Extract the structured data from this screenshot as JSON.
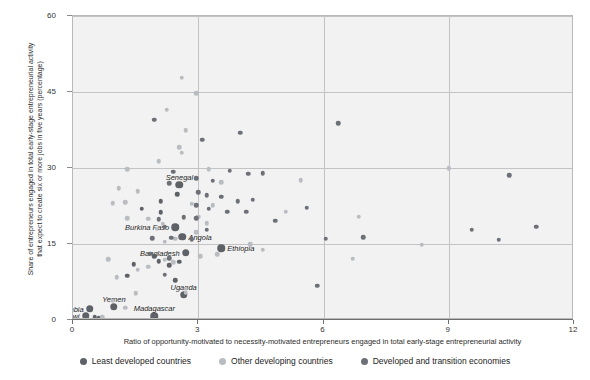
{
  "chart_data": {
    "type": "scatter",
    "title": "",
    "xlabel": "Ratio of opportunity-motivated to necessity-motivated entrepreneurs engaged in total early-stage entrepreneurial activity",
    "ylabel_line1": "Share of entrepreneurs engaged in total early-stage entrepreneurial activity",
    "ylabel_line2": "that expect to create six or more jobs in five years (percentage)",
    "xlim": [
      0,
      12
    ],
    "ylim": [
      0,
      60
    ],
    "xticks": [
      0,
      3,
      6,
      9,
      12
    ],
    "yticks": [
      0,
      15,
      30,
      45,
      60
    ],
    "grid": true,
    "legend_position": "bottom",
    "colors": {
      "least_developed": "#5e6166",
      "other_developing": "#b9bcc0",
      "developed_transition": "#6d7076",
      "plot_background": "#f2f2f2",
      "gridline": "#c3c3c3",
      "axis": "#6f6f6f"
    },
    "series": [
      {
        "name": "Least developed countries",
        "key": "ldc",
        "points": [
          {
            "x": 0.3,
            "y": 0.8,
            "label": "Malawi",
            "label_pos": "left"
          },
          {
            "x": 0.52,
            "y": 0.5
          },
          {
            "x": 0.62,
            "y": 0.3
          },
          {
            "x": 0.4,
            "y": 2.2,
            "label": "Zambia",
            "label_pos": "left"
          },
          {
            "x": 0.98,
            "y": 2.6,
            "label": "Yemen",
            "label_pos": "above"
          },
          {
            "x": 1.95,
            "y": 0.7,
            "label": "Madagascar",
            "label_pos": "above"
          },
          {
            "x": 2.65,
            "y": 5.0,
            "label": "Uganda",
            "label_pos": "above"
          },
          {
            "x": 2.45,
            "y": 7.8
          },
          {
            "x": 2.55,
            "y": 11.5
          },
          {
            "x": 2.3,
            "y": 10.8
          },
          {
            "x": 2.7,
            "y": 13.3,
            "label": "Bangladesh",
            "label_pos": "left"
          },
          {
            "x": 2.62,
            "y": 16.4,
            "label": "Angola",
            "label_pos": "right"
          },
          {
            "x": 2.45,
            "y": 18.3,
            "label": "Burkina Faso",
            "label_pos": "left"
          },
          {
            "x": 3.55,
            "y": 14.2,
            "label": "Ethiopia",
            "label_pos": "right"
          },
          {
            "x": 2.1,
            "y": 23.4
          },
          {
            "x": 2.1,
            "y": 21.3
          },
          {
            "x": 2.5,
            "y": 24.8
          },
          {
            "x": 2.55,
            "y": 26.7,
            "label": "Senegal",
            "label_pos": "above"
          },
          {
            "x": 1.65,
            "y": 22.0
          },
          {
            "x": 1.95,
            "y": 12.6
          },
          {
            "x": 2.05,
            "y": 11.6
          },
          {
            "x": 1.45,
            "y": 11.0
          },
          {
            "x": 1.3,
            "y": 8.7
          }
        ]
      },
      {
        "name": "Other developing countries",
        "key": "odc",
        "points": [
          {
            "x": 2.6,
            "y": 47.8
          },
          {
            "x": 2.25,
            "y": 41.5
          },
          {
            "x": 2.95,
            "y": 44.8
          },
          {
            "x": 2.7,
            "y": 37.5
          },
          {
            "x": 2.55,
            "y": 34.1
          },
          {
            "x": 2.6,
            "y": 33.0
          },
          {
            "x": 2.05,
            "y": 31.3
          },
          {
            "x": 1.3,
            "y": 29.8
          },
          {
            "x": 3.25,
            "y": 29.8
          },
          {
            "x": 3.55,
            "y": 27.2
          },
          {
            "x": 5.45,
            "y": 27.6
          },
          {
            "x": 1.1,
            "y": 26.0
          },
          {
            "x": 1.55,
            "y": 25.4
          },
          {
            "x": 0.95,
            "y": 23.0
          },
          {
            "x": 1.25,
            "y": 23.2
          },
          {
            "x": 1.3,
            "y": 20.1
          },
          {
            "x": 1.8,
            "y": 20.0
          },
          {
            "x": 2.15,
            "y": 19.0
          },
          {
            "x": 2.0,
            "y": 18.0
          },
          {
            "x": 3.0,
            "y": 20.4
          },
          {
            "x": 3.2,
            "y": 19.1
          },
          {
            "x": 2.95,
            "y": 17.3
          },
          {
            "x": 2.45,
            "y": 16.0
          },
          {
            "x": 2.2,
            "y": 15.4
          },
          {
            "x": 3.45,
            "y": 13.0
          },
          {
            "x": 3.05,
            "y": 12.6
          },
          {
            "x": 2.4,
            "y": 11.4
          },
          {
            "x": 2.2,
            "y": 11.9
          },
          {
            "x": 1.8,
            "y": 10.5
          },
          {
            "x": 1.55,
            "y": 9.9
          },
          {
            "x": 1.05,
            "y": 8.4
          },
          {
            "x": 1.5,
            "y": 5.3
          },
          {
            "x": 0.95,
            "y": 3.8
          },
          {
            "x": 1.25,
            "y": 2.4
          },
          {
            "x": 0.7,
            "y": 0.6
          },
          {
            "x": 2.7,
            "y": 5.4
          },
          {
            "x": 2.7,
            "y": 6.2
          },
          {
            "x": 4.55,
            "y": 13.9
          },
          {
            "x": 4.25,
            "y": 15.0
          },
          {
            "x": 6.7,
            "y": 12.1
          },
          {
            "x": 6.85,
            "y": 20.4
          },
          {
            "x": 5.1,
            "y": 21.4
          },
          {
            "x": 8.35,
            "y": 14.9
          },
          {
            "x": 9.0,
            "y": 30.0
          },
          {
            "x": 2.85,
            "y": 22.9
          },
          {
            "x": 3.35,
            "y": 22.6
          },
          {
            "x": 0.85,
            "y": 12.0
          }
        ]
      },
      {
        "name": "Developed and transition economies",
        "key": "dte",
        "points": [
          {
            "x": 1.95,
            "y": 39.5
          },
          {
            "x": 3.1,
            "y": 35.6
          },
          {
            "x": 4.0,
            "y": 37.0
          },
          {
            "x": 6.35,
            "y": 38.8
          },
          {
            "x": 3.75,
            "y": 29.5
          },
          {
            "x": 4.2,
            "y": 28.9
          },
          {
            "x": 4.55,
            "y": 29.0
          },
          {
            "x": 2.4,
            "y": 29.3
          },
          {
            "x": 2.95,
            "y": 28.0
          },
          {
            "x": 3.35,
            "y": 27.5
          },
          {
            "x": 2.3,
            "y": 27.0
          },
          {
            "x": 3.2,
            "y": 24.6
          },
          {
            "x": 3.55,
            "y": 24.3
          },
          {
            "x": 3.95,
            "y": 23.4
          },
          {
            "x": 4.3,
            "y": 23.7
          },
          {
            "x": 2.95,
            "y": 22.6
          },
          {
            "x": 3.0,
            "y": 25.2
          },
          {
            "x": 3.25,
            "y": 22.0
          },
          {
            "x": 4.15,
            "y": 21.4
          },
          {
            "x": 3.7,
            "y": 21.4
          },
          {
            "x": 2.95,
            "y": 20.1
          },
          {
            "x": 2.65,
            "y": 20.3
          },
          {
            "x": 4.85,
            "y": 19.6
          },
          {
            "x": 5.6,
            "y": 22.2
          },
          {
            "x": 6.05,
            "y": 16.0
          },
          {
            "x": 6.95,
            "y": 16.3
          },
          {
            "x": 5.85,
            "y": 6.8
          },
          {
            "x": 9.55,
            "y": 17.8
          },
          {
            "x": 10.2,
            "y": 15.8
          },
          {
            "x": 11.1,
            "y": 18.4
          },
          {
            "x": 10.45,
            "y": 28.6
          },
          {
            "x": 3.2,
            "y": 17.8
          },
          {
            "x": 2.85,
            "y": 15.9
          },
          {
            "x": 2.35,
            "y": 16.2
          },
          {
            "x": 1.9,
            "y": 16.1
          },
          {
            "x": 2.2,
            "y": 18.4
          },
          {
            "x": 2.05,
            "y": 19.9
          },
          {
            "x": 1.85,
            "y": 13.1
          },
          {
            "x": 2.3,
            "y": 12.2
          },
          {
            "x": 2.2,
            "y": 8.9
          }
        ]
      }
    ]
  },
  "legend": {
    "items": [
      {
        "label": "Least developed countries",
        "color": "#5e6166"
      },
      {
        "label": "Other developing countries",
        "color": "#b9bcc0"
      },
      {
        "label": "Developed and transition economies",
        "color": "#6d7076"
      }
    ]
  }
}
